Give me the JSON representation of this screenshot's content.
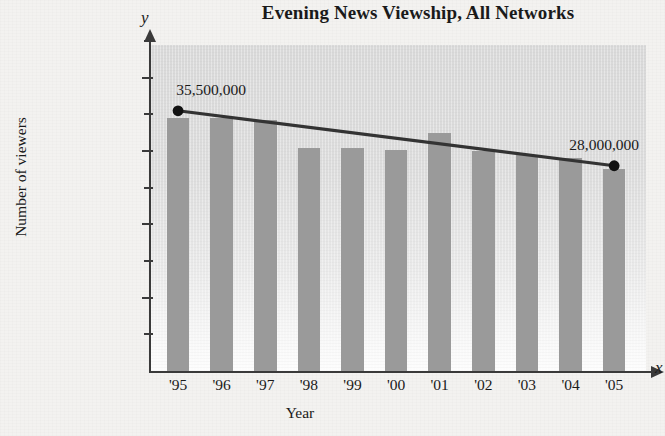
{
  "chart_data": {
    "type": "bar",
    "title": "Evening News Viewship, All Networks",
    "xlabel": "Year",
    "ylabel": "Number of viewers",
    "x_axis_letter": "y",
    "y_axis_letter": "x",
    "axis_letters": {
      "vertical": "y",
      "horizontal": "x"
    },
    "categories": [
      "'95",
      "'96",
      "'97",
      "'98",
      "'99",
      "'00",
      "'01",
      "'02",
      "'03",
      "'04",
      "'05"
    ],
    "values": [
      34500000,
      34500000,
      34300000,
      30400000,
      30400000,
      30200000,
      32500000,
      30000000,
      29500000,
      29000000,
      27500000
    ],
    "ylim": [
      0,
      45000000
    ],
    "ytick_values": [
      10000000,
      20000000,
      30000000,
      40000000
    ],
    "ytick_labels": [
      "10,000,000",
      "20,000,000",
      "30,000,000",
      "40,000,000"
    ],
    "yminor_tick_values": [
      5000000,
      15000000,
      25000000,
      35000000,
      45000000
    ],
    "grid": false,
    "legend": null,
    "series": [
      {
        "name": "bars",
        "type": "bar",
        "values": [
          34500000,
          34500000,
          34300000,
          30400000,
          30400000,
          30200000,
          32500000,
          30000000,
          29500000,
          29000000,
          27500000
        ]
      },
      {
        "name": "trend-line",
        "type": "line",
        "points": [
          {
            "category": "'95",
            "value": 35500000,
            "label": "35,500,000",
            "marker": "dot"
          },
          {
            "category": "'05",
            "value": 28000000,
            "label": "28,000,000",
            "marker": "dot"
          }
        ]
      }
    ],
    "annotations": [
      {
        "text": "35,500,000",
        "category": "'95",
        "value": 35500000
      },
      {
        "text": "28,000,000",
        "category": "'05",
        "value": 28000000
      }
    ],
    "colors": {
      "bar": "#9a9a9a",
      "line": "#333333",
      "marker": "#111111",
      "plot_background_top": "#d9d9d9",
      "plot_background_bottom": "#fdfdfd",
      "page_background": "#f2f1ef",
      "axis": "#3a3a3a",
      "text": "#1a1a1a"
    }
  }
}
